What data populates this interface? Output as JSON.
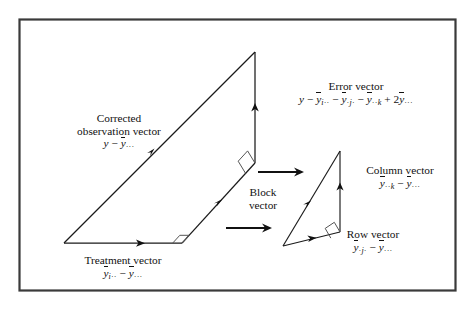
{
  "figure": {
    "kind": "geometric-decomposition-diagram",
    "frame": {
      "color": "#3a3a3a"
    },
    "line_color": "#111111"
  },
  "labels": {
    "corrected": {
      "line1": "Corrected",
      "line2": "observation vector",
      "math_y": "y",
      "math_minus": "−",
      "math_ybar": "y",
      "math_sub": "···"
    },
    "error": {
      "title": "Error vector",
      "m_y": "y",
      "m_minus1": "−",
      "m_yb1": "y",
      "m_sub1_i": "i",
      "m_sub1_d": "··",
      "m_minus2": "−",
      "m_yb2": "y",
      "m_sub2_d1": "·",
      "m_sub2_j": "j",
      "m_sub2_d2": "·",
      "m_minus3": "−",
      "m_yb3": "y",
      "m_sub3_d": "··",
      "m_sub3_k": "k",
      "m_plus": "+",
      "m_two": "2",
      "m_yb4": "y",
      "m_sub4": "···"
    },
    "treatment": {
      "title": "Treatment vector",
      "m_yb1": "y",
      "m_sub1_i": "i",
      "m_sub1_d": "··",
      "m_minus": "−",
      "m_yb2": "y",
      "m_sub2": "···"
    },
    "block": {
      "line1": "Block",
      "line2": "vector"
    },
    "column": {
      "title": "Column vector",
      "m_yb1": "y",
      "m_sub1_d": "··",
      "m_sub1_k": "k",
      "m_minus": "−",
      "m_yb2": "y",
      "m_sub2": "···"
    },
    "row": {
      "title": "Row vector",
      "m_yb1": "y",
      "m_sub1_d1": "·",
      "m_sub1_j": "j",
      "m_sub1_d2": "·",
      "m_minus": "−",
      "m_yb2": "y",
      "m_sub2": "···"
    }
  }
}
